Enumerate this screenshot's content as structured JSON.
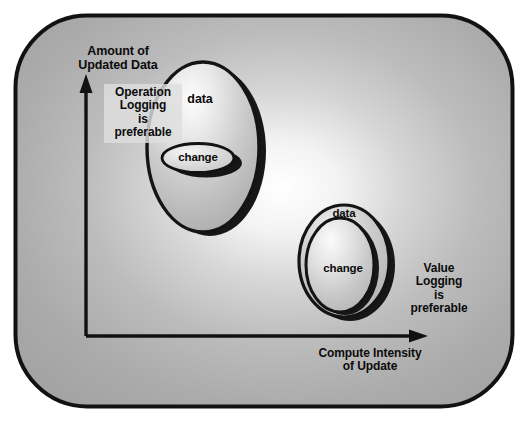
{
  "diagram": {
    "frame": {
      "shape": "rounded-rectangle",
      "fill_gradient": "radial light-center to gray edges",
      "border_color": "#111111"
    },
    "axes": {
      "y_label": "Amount of\nUpdated Data",
      "x_label": "Compute Intensity\nof  Update",
      "axis_color": "#111111",
      "origin": [
        86,
        336
      ],
      "y_arrow_tip": [
        86,
        76
      ],
      "x_arrow_tip": [
        428,
        336
      ]
    },
    "annotations": [
      {
        "name": "operation-logging",
        "text": "Operation\nLogging\nis\npreferable",
        "highlight_color": "#dedede"
      },
      {
        "name": "value-logging",
        "text": "Value\nLogging\nis\npreferable",
        "highlight_color": "none"
      }
    ],
    "shapes": [
      {
        "name": "large-data-ellipse",
        "outer_label": "data",
        "inner_label": "change",
        "region": "upper-left",
        "meaning": "large amount of updated data, low compute intensity",
        "fill": "#c9c9c9",
        "stroke": "#141414"
      },
      {
        "name": "small-data-ellipse",
        "outer_label": "data",
        "inner_label": "change",
        "region": "lower-right",
        "meaning": "small amount of updated data, high compute intensity",
        "fill": "#c9c9c9",
        "stroke": "#141414"
      }
    ],
    "colors": {
      "background": "#ffffff",
      "frame_gray": "#a8a8a8",
      "frame_light": "#f6f6f6",
      "ink": "#111111",
      "shadow": "#1a1a1a"
    }
  }
}
